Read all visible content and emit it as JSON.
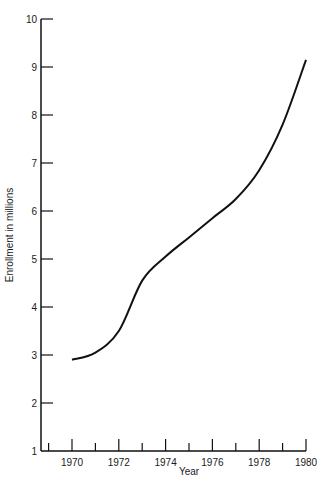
{
  "chart_data": {
    "type": "line",
    "title": "",
    "xlabel": "Year",
    "ylabel": "Enrollment in millions",
    "xlim": [
      1969,
      1980
    ],
    "ylim": [
      1,
      10
    ],
    "x_tick_labels": [
      "1970",
      "1972",
      "1974",
      "1976",
      "1978",
      "1980"
    ],
    "y_tick_labels": [
      "1",
      "2",
      "3",
      "4",
      "5",
      "6",
      "7",
      "8",
      "9",
      "10"
    ],
    "grid": false,
    "legend": null,
    "series": [
      {
        "name": "Enrollment",
        "x": [
          1970,
          1971,
          1972,
          1973,
          1974,
          1975,
          1976,
          1977,
          1978,
          1979,
          1980
        ],
        "values": [
          2.9,
          3.05,
          3.5,
          4.55,
          5.05,
          5.45,
          5.85,
          6.25,
          6.85,
          7.8,
          9.15
        ]
      }
    ]
  },
  "axes": {
    "x_title": "Year",
    "y_title": "Enrollment in millions"
  }
}
